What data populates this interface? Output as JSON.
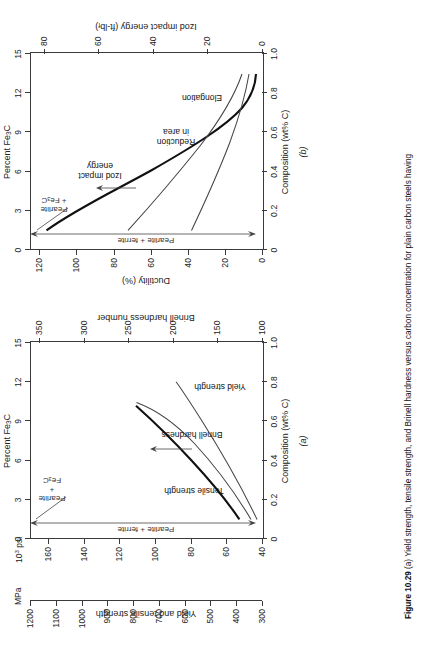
{
  "figure": {
    "number": "Figure 10.29",
    "caption_a": "(a) Yield strength, tensile strength, and Brinell hardness versus carbon concentration for plain carbon steels having",
    "panel_a_label": "(a)",
    "panel_b_label": "(b)"
  },
  "chart_data": [
    {
      "id": "a",
      "type": "line",
      "title": "",
      "xlabel": "Composition (wt% C)",
      "xlim": [
        0,
        1.0
      ],
      "xticks": [
        0,
        0.2,
        0.4,
        0.6,
        0.8,
        1.0
      ],
      "xticklabels": [
        "0",
        "0.2",
        "0.4",
        "0.6",
        "0.8",
        "1.0"
      ],
      "top_axis_label": "Percent Fe3C",
      "top_axis_label_html": "Percent Fe<sub>3</sub>C",
      "top_xlim": [
        0,
        15
      ],
      "top_xticks": [
        0,
        3,
        6,
        9,
        12,
        15
      ],
      "top_xticklabels": [
        "0",
        "3",
        "6",
        "9",
        "12",
        "15"
      ],
      "ylabel_left_outer": "MPa",
      "ylabel_left_inner": "10^3 psi",
      "ylabel_left_inner_html": "10<sup>3</sup> psi",
      "ylabel_left_title": "Yield and tensile strength",
      "ylabel_right_title": "Brinell hardness number",
      "mpa_lim": [
        300,
        1200
      ],
      "mpa_ticks": [
        300,
        400,
        500,
        600,
        700,
        800,
        900,
        1000,
        1100,
        1200
      ],
      "mpa_ticklabels": [
        "300",
        "400",
        "500",
        "600",
        "700",
        "800",
        "900",
        "1000",
        "1100",
        "1200"
      ],
      "psi_lim": [
        40,
        170
      ],
      "psi_ticks": [
        40,
        60,
        80,
        100,
        120,
        140,
        160
      ],
      "psi_ticklabels": [
        "40",
        "60",
        "80",
        "100",
        "120",
        "140",
        "160"
      ],
      "bhn_lim": [
        100,
        360
      ],
      "bhn_ticks": [
        100,
        150,
        200,
        250,
        300,
        350
      ],
      "bhn_ticklabels": [
        "100",
        "150",
        "200",
        "250",
        "300",
        "350"
      ],
      "grid": false,
      "series": [
        {
          "name": "Tensile strength",
          "style": "thick",
          "x": [
            0.1,
            0.2,
            0.3,
            0.4,
            0.5,
            0.6,
            0.7,
            0.8,
            0.9,
            0.95
          ],
          "y_psi": [
            58,
            69,
            80,
            91,
            102,
            112,
            122,
            132,
            142,
            147
          ]
        },
        {
          "name": "Brinell hardness",
          "style": "thin",
          "x": [
            0.1,
            0.2,
            0.3,
            0.4,
            0.5,
            0.6,
            0.7,
            0.8,
            0.9,
            0.95
          ],
          "y_bhn": [
            113,
            130,
            150,
            170,
            190,
            212,
            235,
            260,
            290,
            310
          ]
        },
        {
          "name": "Yield strength",
          "style": "thin",
          "x": [
            0.1,
            0.2,
            0.3,
            0.4,
            0.5,
            0.6,
            0.7,
            0.8,
            0.9,
            1.0
          ],
          "y_psi": [
            42,
            46,
            50,
            55,
            60,
            65,
            70,
            76,
            82,
            88
          ]
        }
      ],
      "annotations": [
        {
          "text": "Tensile strength"
        },
        {
          "text": "Brinell hardness"
        },
        {
          "text": "Yield strength"
        },
        {
          "text": "Pearlite + ferrite"
        },
        {
          "text": "Pearlite + Fe3C",
          "html": "Pearlite<br>+<br>Fe<sub>3</sub>C"
        }
      ]
    },
    {
      "id": "b",
      "type": "line",
      "title": "",
      "xlabel": "Composition (wt% C)",
      "xlim": [
        0,
        1.0
      ],
      "xticks": [
        0,
        0.2,
        0.4,
        0.6,
        0.8,
        1.0
      ],
      "xticklabels": [
        "0",
        "0.2",
        "0.4",
        "0.6",
        "0.8",
        "1.0"
      ],
      "top_axis_label": "Percent Fe3C",
      "top_axis_label_html": "Percent Fe<sub>3</sub>C",
      "top_xlim": [
        0,
        15
      ],
      "top_xticks": [
        0,
        3,
        6,
        9,
        12,
        15
      ],
      "top_xticklabels": [
        "0",
        "3",
        "6",
        "9",
        "12",
        "15"
      ],
      "ylabel_left_title": "Ductility (%)",
      "ylabel_right_title": "Izod impact energy (ft-lbf)",
      "ductility_lim": [
        0,
        125
      ],
      "ductility_ticks": [
        0,
        20,
        40,
        60,
        80,
        100,
        120
      ],
      "ductility_ticklabels": [
        "0",
        "20",
        "40",
        "60",
        "80",
        "100",
        "120"
      ],
      "izod_lim": [
        0,
        85
      ],
      "izod_ticks": [
        0,
        20,
        40,
        60,
        80
      ],
      "izod_ticklabels": [
        "0",
        "20",
        "40",
        "60",
        "80"
      ],
      "grid": false,
      "series": [
        {
          "name": "Izod impact energy",
          "style": "thick",
          "x": [
            0.1,
            0.2,
            0.3,
            0.4,
            0.5,
            0.6,
            0.7,
            0.8,
            0.9,
            0.95
          ],
          "y_izod": [
            79,
            57,
            40,
            28,
            20,
            14,
            10,
            6,
            3,
            2
          ]
        },
        {
          "name": "Reduction in area",
          "style": "thin",
          "x": [
            0.1,
            0.2,
            0.3,
            0.4,
            0.5,
            0.6,
            0.7,
            0.8,
            0.9,
            0.95
          ],
          "y_duct": [
            72,
            63,
            55,
            48,
            42,
            36,
            31,
            26,
            21,
            18
          ]
        },
        {
          "name": "Elongation",
          "style": "thin",
          "x": [
            0.1,
            0.2,
            0.3,
            0.4,
            0.5,
            0.6,
            0.7,
            0.8,
            0.9,
            0.95
          ],
          "y_duct": [
            38,
            34,
            30,
            26,
            23,
            20,
            17,
            14,
            11,
            9
          ]
        }
      ],
      "annotations": [
        {
          "text": "Izod impact energy"
        },
        {
          "text": "Reduction in area"
        },
        {
          "text": "Elongation"
        },
        {
          "text": "Pearlite + ferrite"
        },
        {
          "text": "Pearlite + Fe3C",
          "html": "Pearlite<br>+ Fe<sub>3</sub>C"
        }
      ]
    }
  ]
}
